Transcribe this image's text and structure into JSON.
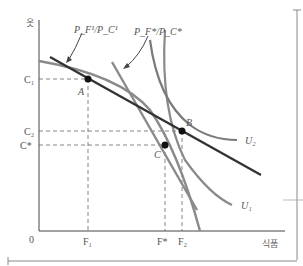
{
  "diagram": {
    "type": "economics-indifference-curve",
    "axes": {
      "y_label": "옷",
      "x_label": "식품",
      "origin": "0"
    },
    "y_ticks": [
      "C₁",
      "C₂",
      "C*"
    ],
    "x_ticks": [
      "F₁",
      "F*",
      "F₂"
    ],
    "points": [
      "A",
      "B",
      "C"
    ],
    "curves": [
      "U₁",
      "U₂"
    ],
    "price_ratio_labels": {
      "original": "P_F¹/P_C¹",
      "new": "P_F*/P_C*"
    },
    "colors": {
      "budget_line": "#333333",
      "curve": "#8a8a8a",
      "steep_line": "#777777",
      "axis": "#444444"
    }
  }
}
